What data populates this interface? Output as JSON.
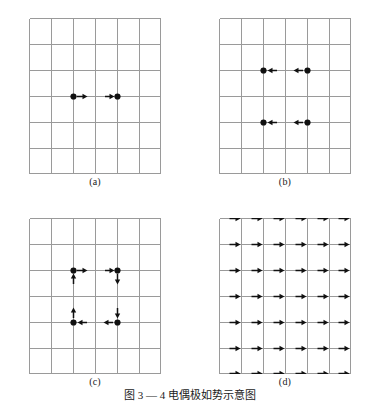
{
  "figure": {
    "caption": "图 3 — 4  电偶极如势示意图",
    "background": "#ffffff",
    "grid_color": "#9a9a9a",
    "mark_color": "#111111",
    "grid": {
      "cols": 6,
      "rows": 6
    },
    "panels": [
      {
        "id": "a",
        "label": "(a)",
        "description": "two dots on the centre horizontal line, both with rightward arrows",
        "dots": [
          {
            "col": 2,
            "row": 3
          },
          {
            "col": 4,
            "row": 3
          }
        ],
        "arrows": [
          {
            "col": 2,
            "row": 3,
            "dir": "right",
            "offset": "after"
          },
          {
            "col": 4,
            "row": 3,
            "dir": "right",
            "offset": "before"
          }
        ]
      },
      {
        "id": "b",
        "label": "(b)",
        "description": "four dots in two rows, all arrows pointing left",
        "dots": [
          {
            "col": 2,
            "row": 2
          },
          {
            "col": 4,
            "row": 2
          },
          {
            "col": 2,
            "row": 4
          },
          {
            "col": 4,
            "row": 4
          }
        ],
        "arrows": [
          {
            "col": 2,
            "row": 2,
            "dir": "left",
            "offset": "after"
          },
          {
            "col": 4,
            "row": 2,
            "dir": "left",
            "offset": "before"
          },
          {
            "col": 2,
            "row": 4,
            "dir": "left",
            "offset": "after"
          },
          {
            "col": 4,
            "row": 4,
            "dir": "left",
            "offset": "before"
          }
        ]
      },
      {
        "id": "c",
        "label": "(c)",
        "description": "four dots forming a counter-clockwise circulation loop",
        "dots": [
          {
            "col": 2,
            "row": 2
          },
          {
            "col": 4,
            "row": 2
          },
          {
            "col": 2,
            "row": 4
          },
          {
            "col": 4,
            "row": 4
          }
        ],
        "arrows": [
          {
            "col": 2,
            "row": 2,
            "dir": "right",
            "offset": "after"
          },
          {
            "col": 2,
            "row": 2,
            "dir": "up",
            "offset": "below"
          },
          {
            "col": 4,
            "row": 2,
            "dir": "right",
            "offset": "before"
          },
          {
            "col": 4,
            "row": 2,
            "dir": "down",
            "offset": "below"
          },
          {
            "col": 2,
            "row": 4,
            "dir": "up",
            "offset": "above"
          },
          {
            "col": 2,
            "row": 4,
            "dir": "left",
            "offset": "after"
          },
          {
            "col": 4,
            "row": 4,
            "dir": "down",
            "offset": "above"
          },
          {
            "col": 4,
            "row": 4,
            "dir": "left",
            "offset": "before"
          }
        ]
      },
      {
        "id": "d",
        "label": "(d)",
        "description": "uniform field: rightward arrow at every node, 6 columns by 7 rows",
        "uniform_field": {
          "dir": "right",
          "cols": 6,
          "rows": 7
        },
        "dots": [],
        "arrows": []
      }
    ]
  }
}
